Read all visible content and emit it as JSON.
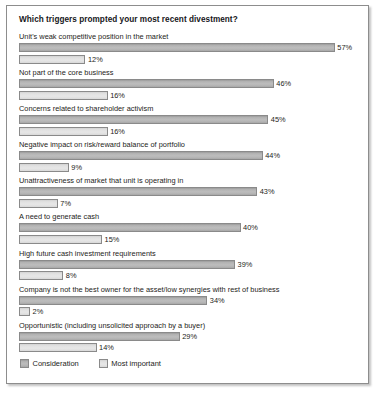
{
  "chart_data": {
    "type": "bar",
    "title": "Which triggers prompted your most recent divestment?",
    "xlabel": "",
    "ylabel": "",
    "xlim": [
      0,
      57
    ],
    "grid": false,
    "orientation": "horizontal",
    "legend_position": "bottom-left",
    "value_suffix": "%",
    "categories": [
      "Unit's weak competitive position in the market",
      "Not part of the core business",
      "Concerns related to shareholder activism",
      "Negative impact on risk/reward balance of portfolio",
      "Unattractiveness of market that unit is operating in",
      "A need to generate cash",
      "High future cash investment requirements",
      "Company is not the best owner for the asset/low synergies with rest of business",
      "Opportunistic (including unsolicited approach by a buyer)"
    ],
    "series": [
      {
        "name": "Consideration",
        "color": "#b3b3b3",
        "values": [
          57,
          46,
          45,
          44,
          43,
          40,
          39,
          34,
          29
        ],
        "labels": [
          "57%",
          "46%",
          "45%",
          "44%",
          "43%",
          "40%",
          "39%",
          "34%",
          "29%"
        ]
      },
      {
        "name": "Most important",
        "color": "#e1e1e1",
        "values": [
          12,
          16,
          16,
          9,
          7,
          15,
          8,
          2,
          14
        ],
        "labels": [
          "12%",
          "16%",
          "16%",
          "9%",
          "7%",
          "15%",
          "8%",
          "2%",
          "14%"
        ]
      }
    ]
  },
  "legend": {
    "items": [
      {
        "label": "Consideration"
      },
      {
        "label": "Most important"
      }
    ]
  }
}
